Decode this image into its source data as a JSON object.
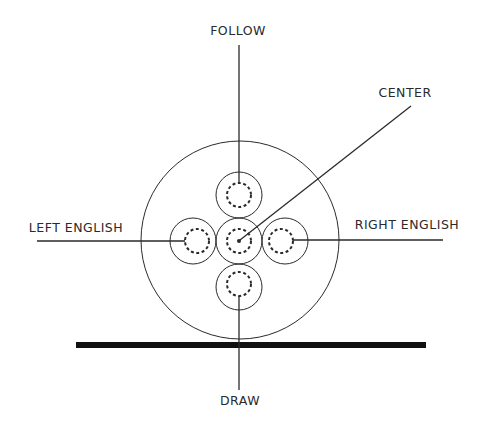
{
  "diagram": {
    "labels": {
      "follow": "FOLLOW",
      "center": "CENTER",
      "left_english": "LEFT ENGLISH",
      "right_english": "RIGHT ENGLISH",
      "draw": "DRAW"
    },
    "colors": {
      "stroke": "#2a2a2a",
      "table_bar": "#111111",
      "background": "#ffffff"
    },
    "cue_ball": {
      "cx": 240,
      "cy": 240,
      "r": 99
    },
    "contact_points": [
      {
        "name": "follow",
        "cx": 239,
        "cy": 195
      },
      {
        "name": "center",
        "cx": 239,
        "cy": 240
      },
      {
        "name": "left-english",
        "cx": 193,
        "cy": 241
      },
      {
        "name": "right-english",
        "cx": 285,
        "cy": 241
      },
      {
        "name": "draw",
        "cx": 239,
        "cy": 287
      }
    ]
  }
}
